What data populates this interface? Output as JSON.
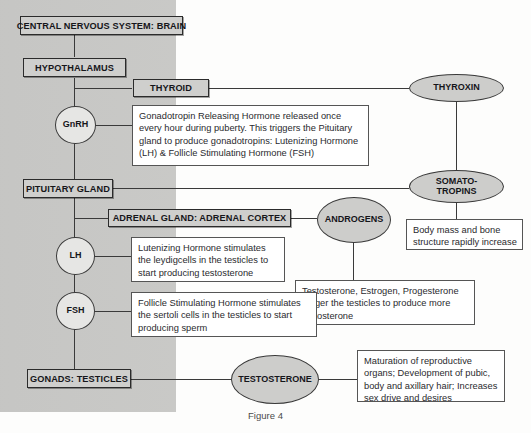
{
  "figure": {
    "caption": "Figure 4"
  },
  "nodes": {
    "cns": "CENTRAL NERVOUS SYSTEM: BRAIN",
    "hypothalamus": "HYPOTHALAMUS",
    "thyroid": "THYROID",
    "pituitary": "PITUITARY GLAND",
    "adrenal": "ADRENAL GLAND: ADRENAL CORTEX",
    "gonads": "GONADS: TESTICLES"
  },
  "hormones": {
    "gnrh": "GnRH",
    "lh": "LH",
    "fsh": "FSH",
    "thyroxin": "THYROXIN",
    "somatotropins": "SOMATO-\nTROPINS",
    "androgens": "ANDROGENS",
    "testosterone": "TESTOSTERONE"
  },
  "notes": {
    "gnrh_note": "Gonadotropin Releasing Hormone released once every hour during puberty. This triggers the Pituitary gland to produce gonadotropins: Lutenizing Hormone (LH) & Follicle Stimulating Hormone (FSH)",
    "somatotropins_note": "Body mass and bone structure rapidly increase",
    "lh_note": "Lutenizing Hormone stimulates the leydigcells in the testicles to start producing testosterone",
    "androgens_note": "Testosterone, Estrogen, Progesterone trigger the testicles to produce more testosterone",
    "fsh_note": "Follicle Stimulating Hormone stimulates the sertoli cells in the testicles to start producing sperm",
    "testosterone_note": "Maturation of reproductive organs; Development of pubic, body and axillary hair; Increases sex drive and desires"
  },
  "colors": {
    "panel_grey": "#c8c8c6",
    "node_fill": "#cfcfcd",
    "node_border": "#2b2b2b",
    "line": "#3a3a3a",
    "note_bg": "#ffffff"
  }
}
